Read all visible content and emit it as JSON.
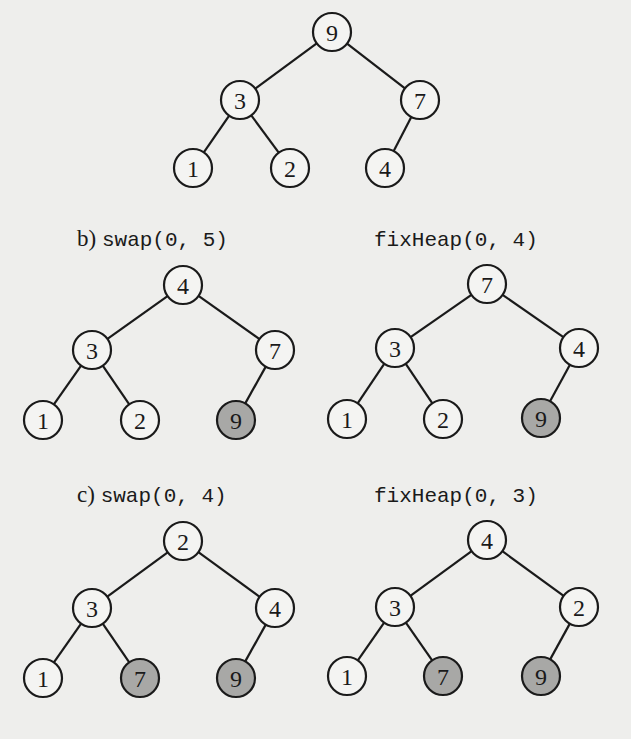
{
  "figure": {
    "colors": {
      "background": "#eeeeec",
      "node_fill": "#f4f4f2",
      "sorted_fill": "#a8a8a6",
      "stroke": "#1a1a1a"
    },
    "node_radius": 19,
    "panels": [
      {
        "id": "a",
        "caption_prefix": "",
        "caption_code": "",
        "caption_pos": [
          0,
          0
        ],
        "nodes": [
          {
            "value": "9",
            "x": 332,
            "y": 32,
            "sorted": false
          },
          {
            "value": "3",
            "x": 240,
            "y": 100,
            "sorted": false
          },
          {
            "value": "7",
            "x": 420,
            "y": 100,
            "sorted": false
          },
          {
            "value": "1",
            "x": 193,
            "y": 168,
            "sorted": false
          },
          {
            "value": "2",
            "x": 290,
            "y": 168,
            "sorted": false
          },
          {
            "value": "4",
            "x": 385,
            "y": 168,
            "sorted": false
          }
        ],
        "edges": [
          [
            0,
            1
          ],
          [
            0,
            2
          ],
          [
            1,
            3
          ],
          [
            1,
            4
          ],
          [
            2,
            5
          ]
        ]
      },
      {
        "id": "b-swap",
        "caption_prefix": "b) ",
        "caption_code": "swap(0, 5)",
        "caption_pos": [
          77,
          226
        ],
        "nodes": [
          {
            "value": "4",
            "x": 183,
            "y": 285,
            "sorted": false
          },
          {
            "value": "3",
            "x": 92,
            "y": 350,
            "sorted": false
          },
          {
            "value": "7",
            "x": 275,
            "y": 350,
            "sorted": false
          },
          {
            "value": "1",
            "x": 43,
            "y": 420,
            "sorted": false
          },
          {
            "value": "2",
            "x": 140,
            "y": 420,
            "sorted": false
          },
          {
            "value": "9",
            "x": 236,
            "y": 420,
            "sorted": true
          }
        ],
        "edges": [
          [
            0,
            1
          ],
          [
            0,
            2
          ],
          [
            1,
            3
          ],
          [
            1,
            4
          ],
          [
            2,
            5
          ]
        ]
      },
      {
        "id": "b-fixheap",
        "caption_prefix": "",
        "caption_code": "fixHeap(0, 4)",
        "caption_pos": [
          374,
          226
        ],
        "nodes": [
          {
            "value": "7",
            "x": 487,
            "y": 284,
            "sorted": false
          },
          {
            "value": "3",
            "x": 395,
            "y": 348,
            "sorted": false
          },
          {
            "value": "4",
            "x": 579,
            "y": 348,
            "sorted": false
          },
          {
            "value": "1",
            "x": 347,
            "y": 419,
            "sorted": false
          },
          {
            "value": "2",
            "x": 443,
            "y": 419,
            "sorted": false
          },
          {
            "value": "9",
            "x": 541,
            "y": 418,
            "sorted": true
          }
        ],
        "edges": [
          [
            0,
            1
          ],
          [
            0,
            2
          ],
          [
            1,
            3
          ],
          [
            1,
            4
          ],
          [
            2,
            5
          ]
        ]
      },
      {
        "id": "c-swap",
        "caption_prefix": "c) ",
        "caption_code": "swap(0, 4)",
        "caption_pos": [
          77,
          482
        ],
        "nodes": [
          {
            "value": "2",
            "x": 183,
            "y": 541,
            "sorted": false
          },
          {
            "value": "3",
            "x": 92,
            "y": 608,
            "sorted": false
          },
          {
            "value": "4",
            "x": 275,
            "y": 608,
            "sorted": false
          },
          {
            "value": "1",
            "x": 43,
            "y": 678,
            "sorted": false
          },
          {
            "value": "7",
            "x": 140,
            "y": 678,
            "sorted": true
          },
          {
            "value": "9",
            "x": 236,
            "y": 678,
            "sorted": true
          }
        ],
        "edges": [
          [
            0,
            1
          ],
          [
            0,
            2
          ],
          [
            1,
            3
          ],
          [
            1,
            4
          ],
          [
            2,
            5
          ]
        ]
      },
      {
        "id": "c-fixheap",
        "caption_prefix": "",
        "caption_code": "fixHeap(0, 3)",
        "caption_pos": [
          374,
          482
        ],
        "nodes": [
          {
            "value": "4",
            "x": 487,
            "y": 540,
            "sorted": false
          },
          {
            "value": "3",
            "x": 395,
            "y": 607,
            "sorted": false
          },
          {
            "value": "2",
            "x": 579,
            "y": 607,
            "sorted": false
          },
          {
            "value": "1",
            "x": 347,
            "y": 676,
            "sorted": false
          },
          {
            "value": "7",
            "x": 443,
            "y": 676,
            "sorted": true
          },
          {
            "value": "9",
            "x": 541,
            "y": 676,
            "sorted": true
          }
        ],
        "edges": [
          [
            0,
            1
          ],
          [
            0,
            2
          ],
          [
            1,
            3
          ],
          [
            1,
            4
          ],
          [
            2,
            5
          ]
        ]
      }
    ]
  }
}
